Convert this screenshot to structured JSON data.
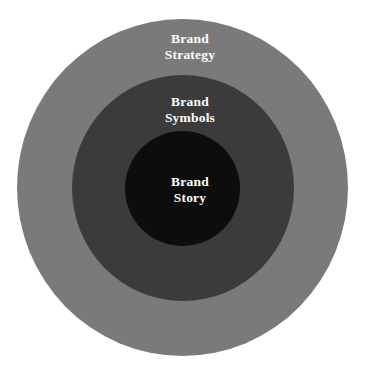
{
  "diagram": {
    "type": "concentric-circles",
    "background_color": "#ffffff",
    "label_color": "#ffffff",
    "rings": [
      {
        "id": "outer",
        "name": "brand-strategy",
        "color": "#7a7a7a",
        "line1": "Brand",
        "line2": "Strategy",
        "full_label": "Brand Strategy"
      },
      {
        "id": "middle",
        "name": "brand-symbols",
        "color": "#3b3b3b",
        "line1": "Brand",
        "line2": "Symbols",
        "full_label": "Brand Symbols"
      },
      {
        "id": "inner",
        "name": "brand-story",
        "color": "#0d0d0d",
        "line1": "Brand",
        "line2": "Story",
        "full_label": "Brand Story"
      }
    ]
  }
}
